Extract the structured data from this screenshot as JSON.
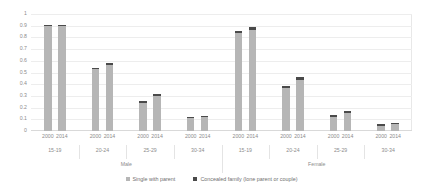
{
  "chart_data": {
    "type": "bar",
    "stacked": true,
    "title": "",
    "subtitle": "",
    "xlabel": "",
    "ylabel": "",
    "ylim": [
      0,
      1
    ],
    "ytick_labels": [
      "0",
      "0.1",
      "0.2",
      "0.3",
      "0.4",
      "0.5",
      "0.6",
      "0.7",
      "0.8",
      "0.9",
      "1"
    ],
    "ytick_values": [
      0,
      0.1,
      0.2,
      0.3,
      0.4,
      0.5,
      0.6,
      0.7,
      0.8,
      0.9,
      1
    ],
    "grid": true,
    "legend_position": "bottom",
    "categories": [
      "Male 15-19 2000",
      "Male 15-19 2014",
      "Male 20-24 2000",
      "Male 20-24 2014",
      "Male 25-29 2000",
      "Male 25-29 2014",
      "Male 30-34 2000",
      "Male 30-34 2014",
      "Female 15-19 2000",
      "Female 15-19 2014",
      "Female 20-24 2000",
      "Female 20-24 2014",
      "Female 25-29 2000",
      "Female 25-29 2014",
      "Female 30-34 2000",
      "Female 30-34 2014"
    ],
    "series": [
      {
        "name": "Single with parent",
        "color": "#b6b6b6",
        "values": [
          0.9,
          0.898,
          0.528,
          0.567,
          0.24,
          0.297,
          0.11,
          0.117,
          0.838,
          0.866,
          0.368,
          0.432,
          0.118,
          0.152,
          0.046,
          0.058
        ]
      },
      {
        "name": "Concealed family (lone parent or couple)",
        "color": "#4a4a4a",
        "values": [
          0.01,
          0.012,
          0.014,
          0.016,
          0.014,
          0.017,
          0.012,
          0.014,
          0.018,
          0.02,
          0.02,
          0.03,
          0.016,
          0.02,
          0.01,
          0.013
        ]
      }
    ],
    "totals": [
      0.91,
      0.91,
      0.542,
      0.583,
      0.254,
      0.314,
      0.122,
      0.131,
      0.856,
      0.886,
      0.388,
      0.462,
      0.134,
      0.172,
      0.056,
      0.071
    ],
    "year_labels": [
      "2000",
      "2014",
      "2000",
      "2014",
      "2000",
      "2014",
      "2000",
      "2014",
      "2000",
      "2014",
      "2000",
      "2014",
      "2000",
      "2014",
      "2000",
      "2014"
    ],
    "age_groups": [
      "15-19",
      "20-24",
      "25-29",
      "30-34",
      "15-19",
      "20-24",
      "25-29",
      "30-34"
    ],
    "sex_groups": [
      "Male",
      "Female"
    ]
  },
  "legend": {
    "items": [
      {
        "label": "Single with parent",
        "color": "#b6b6b6"
      },
      {
        "label": "Concealed family (lone parent or couple)",
        "color": "#4a4a4a"
      }
    ]
  }
}
